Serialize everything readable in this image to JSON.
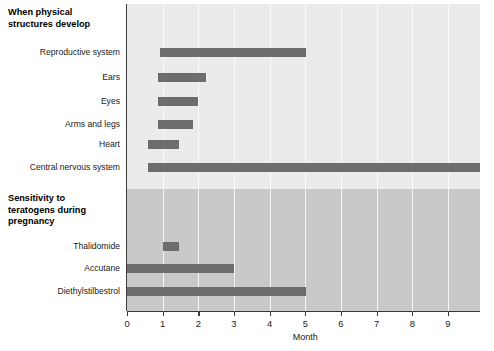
{
  "chart_data": {
    "type": "bar",
    "orientation": "horizontal",
    "title": "",
    "xlabel": "Month",
    "ylabel": "",
    "xlim": [
      0,
      9.9
    ],
    "xticks": [
      0,
      1,
      2,
      3,
      4,
      5,
      6,
      7,
      8,
      9
    ],
    "xtick_labels": [
      "0",
      "1",
      "2",
      "3",
      "4",
      "5",
      "6",
      "7",
      "8",
      "9"
    ],
    "grid": true,
    "legend": "none",
    "bar_color": "#6d6d6d",
    "sections": [
      {
        "heading": "When physical structures develop",
        "background": "#ebebeb",
        "bars": [
          {
            "label": "Reproductive system",
            "start": 0.93,
            "end": 5.03
          },
          {
            "label": "Ears",
            "start": 0.86,
            "end": 2.22
          },
          {
            "label": "Eyes",
            "start": 0.88,
            "end": 1.98
          },
          {
            "label": "Arms and legs",
            "start": 0.88,
            "end": 1.84
          },
          {
            "label": "Heart",
            "start": 0.58,
            "end": 1.45
          },
          {
            "label": "Central nervous system",
            "start": 0.6,
            "end": 9.9
          }
        ]
      },
      {
        "heading": "Sensitivity to teratogens during pregnancy",
        "background": "#c9c9c9",
        "bars": [
          {
            "label": "Thalidomide",
            "start": 1.01,
            "end": 1.46
          },
          {
            "label": "Accutane",
            "start": 0.0,
            "end": 3.0
          },
          {
            "label": "Diethylstilbestrol",
            "start": 0.0,
            "end": 5.02
          }
        ]
      }
    ]
  },
  "headings": {
    "section1_line1": "When physical",
    "section1_line2": "structures develop",
    "section2_line1": "Sensitivity to",
    "section2_line2": "teratogens during",
    "section2_line3": "pregnancy"
  },
  "labels": {
    "reproductive_system": "Reproductive system",
    "ears": "Ears",
    "eyes": "Eyes",
    "arms_and_legs": "Arms and legs",
    "heart": "Heart",
    "central_nervous_system": "Central nervous system",
    "thalidomide": "Thalidomide",
    "accutane": "Accutane",
    "diethylstilbestrol": "Diethylstilbestrol"
  },
  "axis": {
    "title": "Month",
    "tick_0": "0",
    "tick_1": "1",
    "tick_2": "2",
    "tick_3": "3",
    "tick_4": "4",
    "tick_5": "5",
    "tick_6": "6",
    "tick_7": "7",
    "tick_8": "8",
    "tick_9": "9"
  }
}
